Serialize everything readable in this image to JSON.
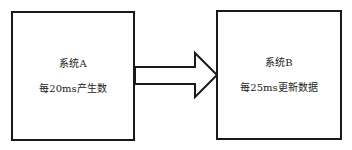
{
  "diagram": {
    "type": "block-flow",
    "nodes": [
      {
        "id": "A",
        "title": "系统A",
        "description": "每20ms产生数"
      },
      {
        "id": "B",
        "title": "系统B",
        "description": "每25ms更新数据"
      }
    ],
    "edges": [
      {
        "from": "A",
        "to": "B",
        "style": "hollow-block-arrow"
      }
    ],
    "colors": {
      "stroke": "#1a1a1a",
      "background": "#ffffff",
      "text": "#222222"
    }
  }
}
